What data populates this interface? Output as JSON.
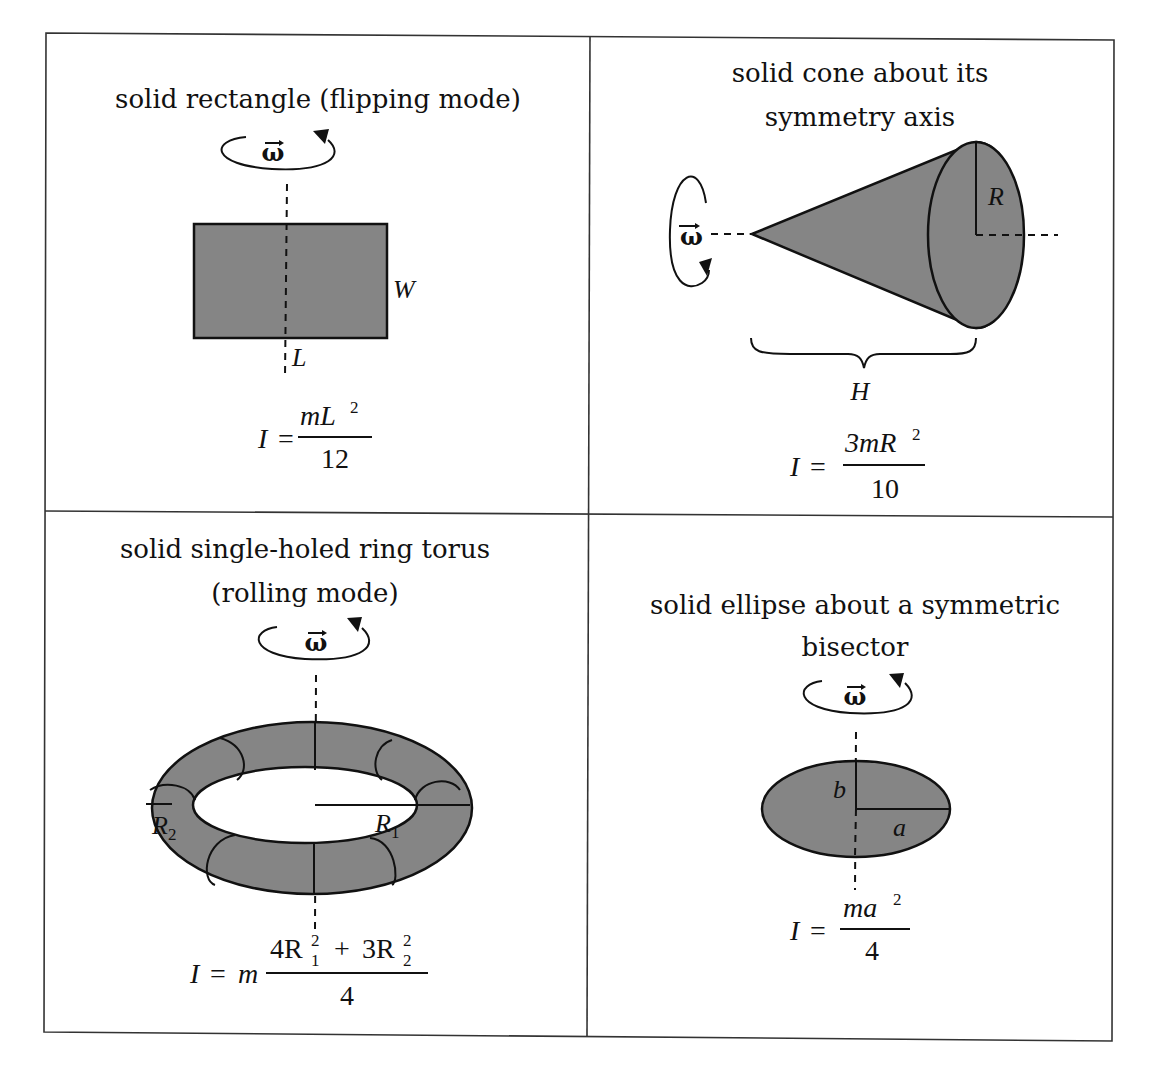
{
  "figure": {
    "rotation_symbol": "ω",
    "cells": [
      {
        "id": "rectangle",
        "title_lines": [
          "solid rectangle (flipping mode)"
        ],
        "labels": {
          "width": "W",
          "length": "L"
        },
        "formula": {
          "lhs": "I =",
          "numerator_main": "mL",
          "numerator_sup": "2",
          "denominator": "12"
        }
      },
      {
        "id": "cone",
        "title_lines": [
          "solid cone about its",
          "symmetry axis"
        ],
        "labels": {
          "radius": "R",
          "height": "H"
        },
        "formula": {
          "lhs": "I =",
          "numerator_main": "3mR",
          "numerator_sup": "2",
          "denominator": "10"
        }
      },
      {
        "id": "torus",
        "title_lines": [
          "solid single-holed ring torus",
          "(rolling mode)"
        ],
        "labels": {
          "r1": "R",
          "r1_sub": "1",
          "r2": "R",
          "r2_sub": "2"
        },
        "formula": {
          "lhs": "I = m",
          "num_a": "4R",
          "num_a_sup": "2",
          "num_a_sub": "1",
          "plus": "+",
          "num_b": "3R",
          "num_b_sup": "2",
          "num_b_sub": "2",
          "denominator": "4"
        }
      },
      {
        "id": "ellipse",
        "title_lines": [
          "solid ellipse about a symmetric",
          "bisector"
        ],
        "labels": {
          "semi_major": "a",
          "semi_minor": "b"
        },
        "formula": {
          "lhs": "I =",
          "numerator_main": "ma",
          "numerator_sup": "2",
          "denominator": "4"
        }
      }
    ]
  }
}
